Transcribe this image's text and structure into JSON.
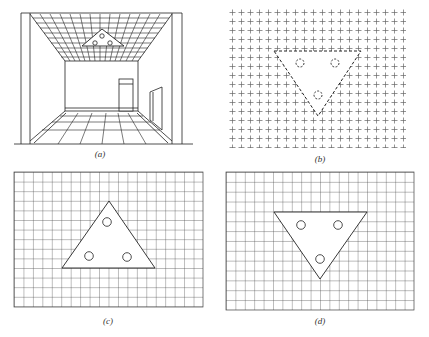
{
  "figure": {
    "panels": [
      {
        "id": "a",
        "label": "(a)",
        "description": "Perspective view of a room with a gridded ceiling containing a triangular light fixture with three circular lamps; door on back wall, window on right wall, tiled floor",
        "label_pos": [
          100,
          155
        ]
      },
      {
        "id": "b",
        "label": "(b)",
        "description": "Ceiling plan drawn as a field of crosses with a dashed inverted triangle containing three dashed circles",
        "label_pos": [
          320,
          160
        ]
      },
      {
        "id": "c",
        "label": "(c)",
        "description": "Ceiling grid with an upright solid triangle containing three circles",
        "label_pos": [
          108,
          322
        ]
      },
      {
        "id": "d",
        "label": "(d)",
        "description": "Ceiling grid with an inverted solid triangle containing three circles",
        "label_pos": [
          320,
          322
        ]
      }
    ],
    "colors": {
      "line": "#222222",
      "grid": "#444444",
      "background": "#ffffff"
    }
  }
}
